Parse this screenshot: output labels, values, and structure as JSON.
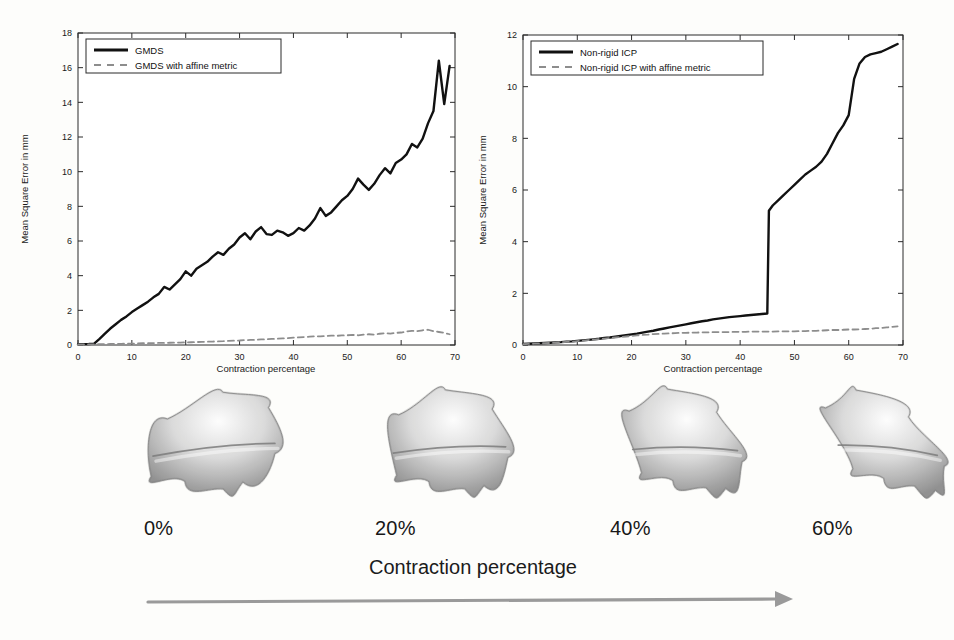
{
  "figure": {
    "background_color": "#fdfdfb",
    "ink_color": "#111111",
    "dashed_color": "#8d8d8d",
    "arrow_color": "#9a9a9a"
  },
  "charts": {
    "left": {
      "xlabel": "Contraction percentage",
      "ylabel": "Mean Square Error in mm",
      "legend": [
        {
          "label": "GMDS",
          "style": "solid",
          "color": "#111111"
        },
        {
          "label": "GMDS with affine metric",
          "style": "dashed",
          "color": "#8d8d8d"
        }
      ],
      "xticks": [
        "0",
        "10",
        "20",
        "30",
        "40",
        "50",
        "60",
        "70"
      ],
      "yticks": [
        "0",
        "2",
        "4",
        "6",
        "8",
        "10",
        "12",
        "14",
        "16",
        "18"
      ]
    },
    "right": {
      "xlabel": "Contraction percentage",
      "ylabel": "Mean Square Error in mm",
      "legend": [
        {
          "label": "Non-rigid ICP",
          "style": "solid",
          "color": "#111111"
        },
        {
          "label": "Non-rigid ICP with affine metric",
          "style": "dashed",
          "color": "#8d8d8d"
        }
      ],
      "xticks": [
        "0",
        "10",
        "20",
        "30",
        "40",
        "50",
        "60",
        "70"
      ],
      "yticks": [
        "0",
        "2",
        "4",
        "6",
        "8",
        "10",
        "12"
      ]
    }
  },
  "shapes": {
    "axis_caption": "Contraction percentage",
    "items": [
      {
        "caption": "0%",
        "elongation": 0.0
      },
      {
        "caption": "20%",
        "elongation": 0.33
      },
      {
        "caption": "40%",
        "elongation": 0.66
      },
      {
        "caption": "60%",
        "elongation": 1.0
      }
    ]
  },
  "chart_data": [
    {
      "type": "line",
      "id": "gmds-error-vs-contraction",
      "title": "",
      "xlabel": "Contraction percentage",
      "ylabel": "Mean Square Error in mm",
      "xlim": [
        0,
        70
      ],
      "ylim": [
        0,
        18
      ],
      "xticks": [
        0,
        10,
        20,
        30,
        40,
        50,
        60,
        70
      ],
      "yticks": [
        0,
        2,
        4,
        6,
        8,
        10,
        12,
        14,
        16,
        18
      ],
      "grid": false,
      "legend_position": "upper-left",
      "x": [
        0,
        1,
        2,
        3,
        4,
        5,
        6,
        7,
        8,
        9,
        10,
        11,
        12,
        13,
        14,
        15,
        16,
        17,
        18,
        19,
        20,
        21,
        22,
        23,
        24,
        25,
        26,
        27,
        28,
        29,
        30,
        31,
        32,
        33,
        34,
        35,
        36,
        37,
        38,
        39,
        40,
        41,
        42,
        43,
        44,
        45,
        46,
        47,
        48,
        49,
        50,
        51,
        52,
        53,
        54,
        55,
        56,
        57,
        58,
        59,
        60,
        61,
        62,
        63,
        64,
        65,
        66,
        67,
        68,
        69
      ],
      "series": [
        {
          "name": "GMDS",
          "style": "solid",
          "color": "#111111",
          "values": [
            0.05,
            0.05,
            0.06,
            0.08,
            0.35,
            0.65,
            0.95,
            1.2,
            1.45,
            1.65,
            1.9,
            2.1,
            2.3,
            2.5,
            2.75,
            2.95,
            3.35,
            3.2,
            3.5,
            3.8,
            4.25,
            4.0,
            4.4,
            4.6,
            4.8,
            5.1,
            5.35,
            5.2,
            5.55,
            5.8,
            6.2,
            6.45,
            6.1,
            6.55,
            6.8,
            6.4,
            6.35,
            6.6,
            6.5,
            6.3,
            6.45,
            6.75,
            6.6,
            6.9,
            7.3,
            7.9,
            7.45,
            7.65,
            8.0,
            8.35,
            8.6,
            9.0,
            9.6,
            9.25,
            8.95,
            9.3,
            9.8,
            10.2,
            9.9,
            10.5,
            10.7,
            11.0,
            11.6,
            11.4,
            11.9,
            12.8,
            13.5,
            16.4,
            13.9,
            16.1
          ]
        },
        {
          "name": "GMDS with affine metric",
          "style": "dashed",
          "color": "#8d8d8d",
          "values": [
            0.03,
            0.03,
            0.04,
            0.04,
            0.05,
            0.05,
            0.06,
            0.06,
            0.07,
            0.08,
            0.08,
            0.09,
            0.1,
            0.1,
            0.11,
            0.12,
            0.12,
            0.13,
            0.14,
            0.14,
            0.15,
            0.16,
            0.17,
            0.18,
            0.19,
            0.2,
            0.21,
            0.22,
            0.24,
            0.25,
            0.26,
            0.28,
            0.29,
            0.3,
            0.32,
            0.33,
            0.35,
            0.36,
            0.38,
            0.4,
            0.42,
            0.44,
            0.46,
            0.48,
            0.5,
            0.5,
            0.52,
            0.54,
            0.53,
            0.55,
            0.56,
            0.58,
            0.56,
            0.6,
            0.62,
            0.6,
            0.65,
            0.68,
            0.66,
            0.7,
            0.72,
            0.78,
            0.82,
            0.8,
            0.85,
            0.88,
            0.8,
            0.75,
            0.7,
            0.62
          ]
        }
      ]
    },
    {
      "type": "line",
      "id": "nonrigid-icp-error-vs-contraction",
      "title": "",
      "xlabel": "Contraction percentage",
      "ylabel": "Mean Square Error in mm",
      "xlim": [
        0,
        70
      ],
      "ylim": [
        0,
        12
      ],
      "xticks": [
        0,
        10,
        20,
        30,
        40,
        50,
        60,
        70
      ],
      "yticks": [
        0,
        2,
        4,
        6,
        8,
        10,
        12
      ],
      "grid": false,
      "legend_position": "upper-left",
      "x": [
        0,
        1,
        2,
        3,
        4,
        5,
        6,
        7,
        8,
        9,
        10,
        11,
        12,
        13,
        14,
        15,
        16,
        17,
        18,
        19,
        20,
        21,
        22,
        23,
        24,
        25,
        26,
        27,
        28,
        29,
        30,
        31,
        32,
        33,
        34,
        35,
        36,
        37,
        38,
        39,
        40,
        41,
        42,
        43,
        44,
        45,
        45.3,
        46,
        47,
        48,
        49,
        50,
        51,
        52,
        53,
        54,
        55,
        56,
        57,
        58,
        59,
        60,
        61,
        62,
        63,
        64,
        65,
        66,
        67,
        68,
        69
      ],
      "series": [
        {
          "name": "Non-rigid ICP",
          "style": "solid",
          "color": "#111111",
          "values": [
            0.04,
            0.05,
            0.06,
            0.07,
            0.08,
            0.09,
            0.1,
            0.11,
            0.13,
            0.14,
            0.16,
            0.18,
            0.2,
            0.22,
            0.24,
            0.27,
            0.29,
            0.32,
            0.35,
            0.38,
            0.41,
            0.44,
            0.48,
            0.52,
            0.55,
            0.6,
            0.64,
            0.68,
            0.72,
            0.76,
            0.8,
            0.84,
            0.88,
            0.92,
            0.95,
            0.99,
            1.02,
            1.05,
            1.08,
            1.1,
            1.12,
            1.14,
            1.16,
            1.18,
            1.2,
            1.22,
            5.2,
            5.4,
            5.6,
            5.8,
            6.0,
            6.2,
            6.4,
            6.6,
            6.75,
            6.9,
            7.1,
            7.4,
            7.8,
            8.2,
            8.5,
            8.9,
            10.3,
            10.9,
            11.15,
            11.25,
            11.3,
            11.35,
            11.45,
            11.55,
            11.65,
            11.72
          ]
        },
        {
          "name": "Non-rigid ICP with affine metric",
          "style": "dashed",
          "color": "#8d8d8d",
          "values": [
            0.03,
            0.04,
            0.05,
            0.06,
            0.07,
            0.08,
            0.09,
            0.1,
            0.12,
            0.13,
            0.15,
            0.17,
            0.19,
            0.21,
            0.23,
            0.25,
            0.27,
            0.29,
            0.31,
            0.33,
            0.35,
            0.37,
            0.39,
            0.4,
            0.42,
            0.43,
            0.44,
            0.45,
            0.46,
            0.47,
            0.47,
            0.48,
            0.48,
            0.49,
            0.49,
            0.5,
            0.5,
            0.5,
            0.5,
            0.51,
            0.51,
            0.51,
            0.52,
            0.52,
            0.52,
            0.52,
            0.52,
            0.52,
            0.53,
            0.53,
            0.53,
            0.53,
            0.54,
            0.54,
            0.55,
            0.55,
            0.56,
            0.57,
            0.58,
            0.58,
            0.59,
            0.6,
            0.6,
            0.61,
            0.62,
            0.63,
            0.65,
            0.66,
            0.68,
            0.7,
            0.72,
            0.74
          ]
        }
      ]
    }
  ]
}
